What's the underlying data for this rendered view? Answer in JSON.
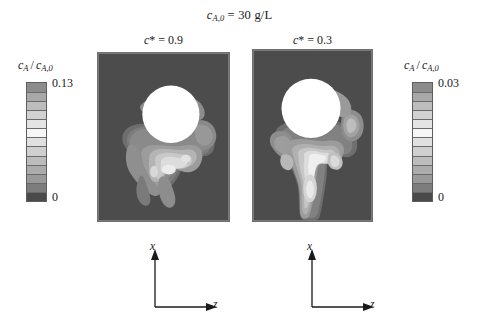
{
  "figure": {
    "title_parts": {
      "var": "c",
      "sub": "A,0",
      "rest": "= 30 g/L"
    },
    "background_color": "#ffffff"
  },
  "panels": [
    {
      "id": "left",
      "title": "c* = 0.9",
      "title_parts": {
        "var": "c",
        "star": "*",
        "rest": "= 0.9"
      },
      "c_star": 0.9,
      "background_color": "#4c4c4c",
      "sphere_color": "#ffffff",
      "axis": {
        "vertical_label": "x",
        "horizontal_label": "z"
      }
    },
    {
      "id": "right",
      "title": "c* = 0.3",
      "title_parts": {
        "var": "c",
        "star": "*",
        "rest": "= 0.3"
      },
      "c_star": 0.3,
      "background_color": "#4c4c4c",
      "sphere_color": "#ffffff",
      "axis": {
        "vertical_label": "x",
        "horizontal_label": "z"
      }
    }
  ],
  "colorbars": [
    {
      "id": "left",
      "caption": "c_A / c_{A,0}",
      "caption_parts": {
        "num_var": "c",
        "num_sub": "A",
        "den_var": "c",
        "den_sub": "A,0"
      },
      "max_label": "0.13",
      "min_label": "0",
      "max_value": 0.13,
      "min_value": 0,
      "band_count": 13,
      "bands_top_to_bottom": [
        "#8c8c8c",
        "#a8a8a8",
        "#bdbdbd",
        "#d2d2d2",
        "#e4e4e4",
        "#f6f6f6",
        "#e0e0e0",
        "#cfcfcf",
        "#bcbcbc",
        "#ababab",
        "#999999",
        "#7d7d7d",
        "#4a4a4a"
      ]
    },
    {
      "id": "right",
      "caption": "c_A / c_{A,0}",
      "caption_parts": {
        "num_var": "c",
        "num_sub": "A",
        "den_var": "c",
        "den_sub": "A,0"
      },
      "max_label": "0.03",
      "min_label": "0",
      "max_value": 0.03,
      "min_value": 0,
      "band_count": 13,
      "bands_top_to_bottom": [
        "#8c8c8c",
        "#a8a8a8",
        "#bdbdbd",
        "#d2d2d2",
        "#e4e4e4",
        "#f6f6f6",
        "#e0e0e0",
        "#cfcfcf",
        "#bcbcbc",
        "#ababab",
        "#999999",
        "#7d7d7d",
        "#4a4a4a"
      ]
    }
  ],
  "chart_data": {
    "type": "heatmap",
    "xlabel": "z",
    "ylabel": "x",
    "grid": false,
    "legend_position": "outside-left-and-right",
    "subplots": [
      {
        "name": "c* = 0.9",
        "colorbar_label": "c_A / c_{A,0}",
        "value_range": [
          0,
          0.13
        ],
        "tick_labels": [
          "0",
          "0.13"
        ],
        "levels": 13,
        "features": {
          "sphere": {
            "center_x_frac": 0.42,
            "center_y_frac": 0.36,
            "radius_frac": 0.21,
            "value": "saturated"
          },
          "plume": "broad low-gradient wake, wide lobe extending left and downward, small lobe right of sphere, diffuse trailing tail"
        }
      },
      {
        "name": "c* = 0.3",
        "colorbar_label": "c_A / c_{A,0}",
        "value_range": [
          0,
          0.03
        ],
        "tick_labels": [
          "0",
          "0.03"
        ],
        "levels": 13,
        "features": {
          "sphere": {
            "center_x_frac": 0.49,
            "center_y_frac": 0.34,
            "radius_frac": 0.24,
            "value": "saturated"
          },
          "plume": "narrow filamentary wake with many closely spaced contour bands, elongated vertical tail reaching panel bottom, lateral wisps on both sides"
        }
      }
    ]
  }
}
